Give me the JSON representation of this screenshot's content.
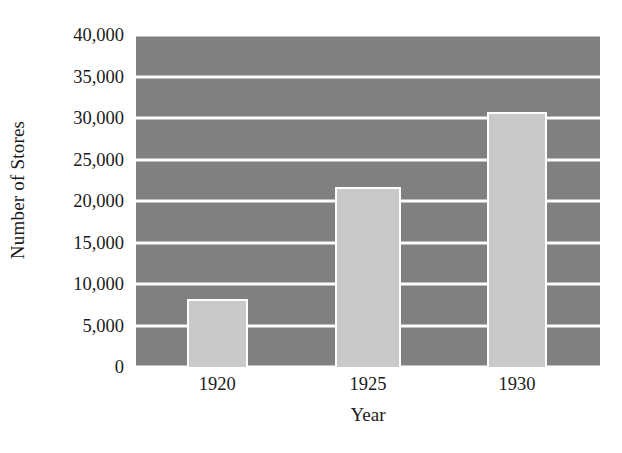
{
  "chart_data": {
    "type": "bar",
    "title": "",
    "xlabel": "Year",
    "ylabel": "Number of Stores",
    "categories": [
      "1920",
      "1925",
      "1930"
    ],
    "values": [
      8200,
      21700,
      30700
    ],
    "series": [
      {
        "name": "Number of Stores",
        "values": [
          8200,
          21700,
          30700
        ]
      }
    ],
    "ylim": [
      0,
      40000
    ],
    "yticks": [
      0,
      5000,
      10000,
      15000,
      20000,
      25000,
      30000,
      35000,
      40000
    ],
    "ytick_labels": [
      "0",
      "5,000",
      "10,000",
      "15,000",
      "20,000",
      "25,000",
      "30,000",
      "35,000",
      "40,000"
    ],
    "xtick_labels": [
      "1920",
      "1925",
      "1930"
    ],
    "grid": true,
    "grid_axis": "y",
    "legend": false,
    "legend_position": "none",
    "colors": {
      "plot_background": "#808080",
      "bar_fill": "#c9c9c9",
      "bar_border": "#fdfdfd",
      "gridline": "#fdfdfd",
      "text": "#1a1a1a",
      "page_background": "#ffffff"
    },
    "bar_geometry": [
      {
        "category": "1920",
        "center_pct": 17.5,
        "width_pct": 13.2
      },
      {
        "category": "1925",
        "center_pct": 50.0,
        "width_pct": 14.2
      },
      {
        "category": "1930",
        "center_pct": 82.1,
        "width_pct": 13.0
      }
    ]
  }
}
